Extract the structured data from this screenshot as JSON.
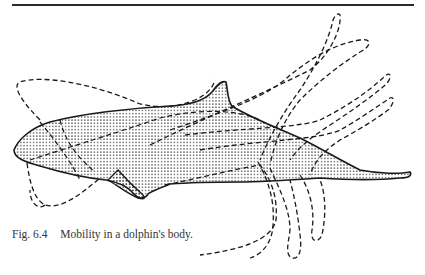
{
  "page": {
    "top_rule": true
  },
  "figure": {
    "fill_pattern": "stipple-dots",
    "outline_color": "#1a1a1a",
    "dash_color": "#1a1a1a"
  },
  "caption": {
    "label": "Fig. 6.4",
    "text": "Mobility in a dolphin's body."
  }
}
